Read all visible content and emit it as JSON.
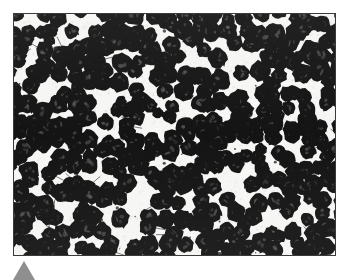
{
  "figure": {
    "kind": "micrograph",
    "caption_text": "",
    "frame": {
      "border_color": "#3a3a3a",
      "background_color": "#f4f4f2",
      "x": 13,
      "y": 13,
      "width": 323,
      "height": 243
    },
    "specimen": {
      "description": "densely packed dark-stained spherical cells on a pale background",
      "cell_fill_color": "#141414",
      "cell_highlight_color": "#4a4a4a",
      "background_color": "#f6f6f4",
      "approximate_cell_count": 330,
      "mean_cell_radius_px": 9,
      "paired_cell_fraction": 0.45
    },
    "marker": {
      "name": "corner-marker",
      "shape": "triangle-up",
      "color": "#8f8f8f",
      "x": 13,
      "y": 261,
      "width": 22,
      "height": 19
    },
    "page_background": "#ffffff"
  }
}
